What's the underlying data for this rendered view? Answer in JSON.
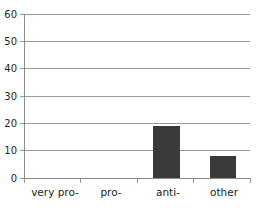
{
  "chart_data": {
    "type": "bar",
    "title": "",
    "subtitle": "",
    "xlabel": "",
    "ylabel": "",
    "categories": [
      "very pro-",
      "pro-",
      "anti-",
      "other"
    ],
    "values": [
      30,
      42,
      19,
      8
    ],
    "series": [
      {
        "name": "",
        "values": [
          30,
          42,
          19,
          8
        ]
      }
    ],
    "ylim": [
      0,
      60
    ],
    "xlim": [
      0,
      4
    ],
    "ytick_labels": [
      "0",
      "10",
      "20",
      "30",
      "40",
      "50",
      "60"
    ],
    "ytick_values": [
      0,
      10,
      20,
      30,
      40,
      50,
      60
    ],
    "ytick_step": 10,
    "grid": true,
    "grid_axis": "y",
    "legend": false,
    "legend_position": "none",
    "annotations": [],
    "colors": {
      "bar_fill": "#3a3a3a",
      "gridline": "#808080",
      "axis": "#808080",
      "text": "#231f20",
      "background": "#ffffff"
    }
  }
}
